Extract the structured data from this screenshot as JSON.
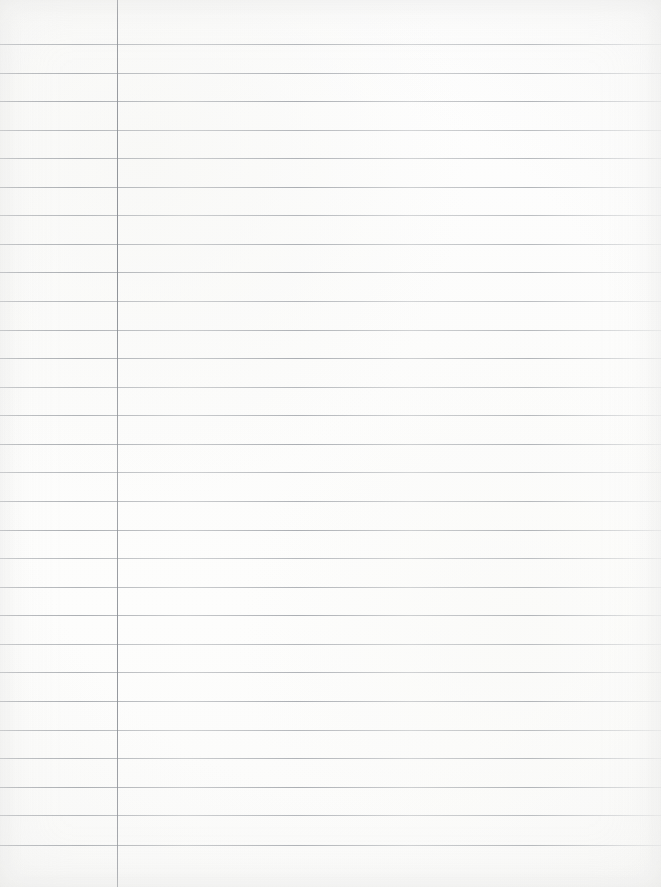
{
  "document": {
    "type": "scanned-lined-paper",
    "title": "Blank ruled notebook page",
    "description": "A scanned blank sheet of wide-ruled lined paper with a single vertical left margin rule and no handwriting or printed text.",
    "width_px": 661,
    "height_px": 887,
    "orientation": "portrait",
    "background_color": "#fdfdfd",
    "has_text_content": "false",
    "text_content": ""
  },
  "ruling": {
    "horizontal_line_color": "#a2a6ab",
    "horizontal_line_thickness_px": 1,
    "horizontal_line_count": 29,
    "first_line_y": 44,
    "line_spacing_px": 28.6,
    "horizontal_line_left_x": 0,
    "horizontal_line_right_x": 661,
    "line_y_positions": [
      44,
      73,
      101,
      130,
      158,
      187,
      215,
      244,
      272,
      301,
      330,
      358,
      387,
      415,
      444,
      472,
      501,
      530,
      558,
      587,
      615,
      644,
      672,
      701,
      730,
      758,
      787,
      815,
      845
    ]
  },
  "margin": {
    "vertical_line_color": "#8e9298",
    "vertical_line_thickness_px": 1,
    "vertical_line_x": 117,
    "vertical_line_top_y": 0,
    "vertical_line_bottom_y": 887,
    "left_margin_width_px": 117
  }
}
